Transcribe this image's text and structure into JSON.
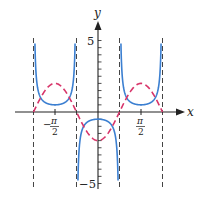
{
  "chart_data": {
    "type": "line",
    "title": "",
    "xlabel": "x",
    "ylabel": "y",
    "xlim": [
      -2.7,
      2.7
    ],
    "ylim": [
      -5.2,
      5.2
    ],
    "grid": false,
    "legend": null,
    "x_ticks": [
      {
        "value": -1.5708,
        "label_num": "π",
        "label_den": "2",
        "sign": "−"
      },
      {
        "value": 1.5708,
        "label_num": "π",
        "label_den": "2",
        "sign": ""
      }
    ],
    "y_ticks": [
      {
        "value": 5,
        "label": "5"
      },
      {
        "value": -5,
        "label": "−5"
      }
    ],
    "y_minor_tick_step": 0.5,
    "asymptotes_x": [
      -2.3562,
      -0.7854,
      0.7854,
      2.3562
    ],
    "series": [
      {
        "name": "y = -2cos(2x)",
        "style": "dashed",
        "color": "#d8356a",
        "formula": "-2*cos(2x)",
        "x_range": [
          -2.3562,
          2.3562
        ],
        "key_points": [
          [
            -2.3562,
            0
          ],
          [
            -1.5708,
            2
          ],
          [
            -0.7854,
            0
          ],
          [
            0,
            -2
          ],
          [
            0.7854,
            0
          ],
          [
            1.5708,
            2
          ],
          [
            2.3562,
            0
          ]
        ]
      },
      {
        "name": "y = -1/(2cos(2x))",
        "style": "solid",
        "color": "#3b7fd1",
        "formula": "-0.5*sec(2x)",
        "key_points": [
          [
            -1.5708,
            0.5
          ],
          [
            0,
            -0.5
          ],
          [
            1.5708,
            0.5
          ]
        ],
        "branches": [
          [
            -2.3562,
            -0.7854
          ],
          [
            -0.7854,
            0.7854
          ],
          [
            0.7854,
            2.3562
          ]
        ],
        "clip_y": [
          -5,
          5
        ]
      }
    ]
  },
  "labels": {
    "x_axis": "x",
    "y_axis": "y",
    "y_top": "5",
    "y_bottom": "−5",
    "x_neg_sign": "−",
    "pi": "π",
    "two": "2"
  },
  "colors": {
    "axis": "#222222",
    "asymptote": "#444444",
    "blue": "#3b7fd1",
    "red": "#d8356a"
  }
}
